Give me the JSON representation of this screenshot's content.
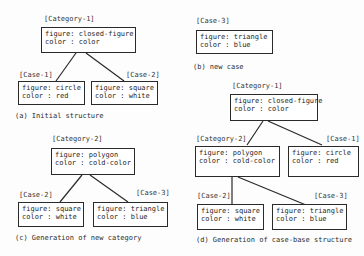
{
  "panels": {
    "a": {
      "caption": "(a) Initial structure",
      "category": {
        "label": "[Category-1]",
        "figure": "figure: closed-figure",
        "color": "color : color"
      },
      "case1": {
        "label": "[Case-1]",
        "figure": "figure: circle",
        "color": "color : red"
      },
      "case2": {
        "label": "[Case-2]",
        "figure": "figure: square",
        "color": "color : white"
      }
    },
    "b": {
      "caption": "(b) new case",
      "case3": {
        "label": "[Case-3]",
        "figure": "figure: triangle",
        "color": "color : blue"
      }
    },
    "c": {
      "caption": "(c) Generation of new category",
      "category": {
        "label": "[Category-2]",
        "figure": "figure: polygon",
        "color": "color : cold-color"
      },
      "case2": {
        "label": "[Case-2]",
        "figure": "figure: square",
        "color": "color : white"
      },
      "case3": {
        "label": "[Case-3]",
        "figure": "figure: triangle",
        "color": "color : blue"
      }
    },
    "d": {
      "caption": "(d) Generation of case-base structure",
      "category1": {
        "label": "[Category-1]",
        "figure": "figure: closed-figure",
        "color": "color : color"
      },
      "category2": {
        "label": "[Category-2]",
        "figure": "figure: polygon",
        "color": "color : cold-color"
      },
      "case1": {
        "label": "[Case-1]",
        "figure": "figure: circle",
        "color": "color : red"
      },
      "case2": {
        "label": "[Case-2]",
        "figure": "figure: square",
        "color": "color : white"
      },
      "case3": {
        "label": "[Case-3]",
        "figure": "figure: triangle",
        "color": "color : blue"
      }
    }
  }
}
